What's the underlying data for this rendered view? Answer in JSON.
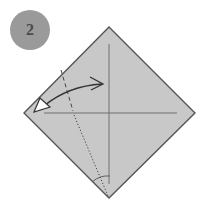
{
  "step": {
    "number": "2",
    "badge_color": "#9a9a9a",
    "number_color": "#4a4a4a"
  },
  "diagram": {
    "paper_color": "#c8c8c8",
    "edge_color": "#555555",
    "line_color": "#666666",
    "arrow_fill": "#ffffff",
    "arrow_stroke": "#333333",
    "icons": {
      "paper": "diamond-square",
      "crease": "solid-crease-lines",
      "valley_fold": "dashed-line",
      "reference": "dotted-line",
      "angle_mark": "arc",
      "fold_arrow": "two-headed-curved-arrow"
    }
  }
}
